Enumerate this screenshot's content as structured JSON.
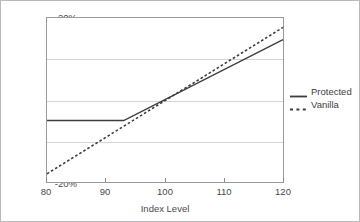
{
  "chart_data": {
    "type": "line",
    "title": "",
    "xlabel": "Index Level",
    "ylabel": "",
    "xlim": [
      80,
      120
    ],
    "ylim": [
      -20,
      20
    ],
    "xticks": [
      80,
      90,
      100,
      110,
      120
    ],
    "xtick_labels": [
      "80",
      "90",
      "100",
      "110",
      "120"
    ],
    "yticks": [
      -20,
      -10,
      0,
      10,
      20
    ],
    "ytick_labels": [
      "-20%",
      "-10%",
      "0%",
      "10%",
      "20%"
    ],
    "grid": "horizontal",
    "legend_position": "right-outside",
    "series": [
      {
        "name": "Protected",
        "style": "solid",
        "color": "#3d3d3d",
        "x": [
          80,
          93,
          120
        ],
        "values": [
          -5.0,
          -5.0,
          14.7
        ]
      },
      {
        "name": "Vanilla",
        "style": "dotted",
        "color": "#3d3d3d",
        "x": [
          80,
          120
        ],
        "values": [
          -18.0,
          17.7
        ]
      }
    ]
  },
  "legend": {
    "items": [
      {
        "label": "Protected",
        "style": "solid"
      },
      {
        "label": "Vanilla",
        "style": "dotted"
      }
    ]
  },
  "axes": {
    "x_title": "Index Level"
  }
}
